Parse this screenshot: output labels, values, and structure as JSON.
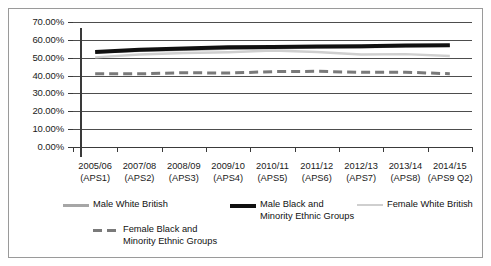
{
  "chart_data": {
    "type": "line",
    "title": "",
    "xlabel": "",
    "ylabel": "",
    "ylim": [
      0,
      70
    ],
    "grid": true,
    "legend_position": "bottom",
    "categories": [
      "2005/06\n(APS1)",
      "2007/08\n(APS2)",
      "2008/09\n(APS3)",
      "2009/10\n(APS4)",
      "2010/11\n(APS5)",
      "2011/12\n(APS6)",
      "2012/13\n(APS7)",
      "2013/14\n(APS8)",
      "2014/15\n(APS9 Q2)"
    ],
    "category_lines": [
      [
        "2005/06",
        "(APS1)"
      ],
      [
        "2007/08",
        "(APS2)"
      ],
      [
        "2008/09",
        "(APS3)"
      ],
      [
        "2009/10",
        "(APS4)"
      ],
      [
        "2010/11",
        "(APS5)"
      ],
      [
        "2011/12",
        "(APS6)"
      ],
      [
        "2012/13",
        "(APS7)"
      ],
      [
        "2013/14",
        "(APS8)"
      ],
      [
        "2014/15",
        "(APS9 Q2)"
      ]
    ],
    "ytick_labels": [
      "70.00%",
      "60.00%",
      "50.00%",
      "40.00%",
      "30.00%",
      "20.00%",
      "10.00%",
      "0.00%"
    ],
    "ytick_values": [
      70,
      60,
      50,
      40,
      30,
      20,
      10,
      0
    ],
    "series": [
      {
        "name": "Male White British",
        "color": "#a6a6a6",
        "style": "solid",
        "width": 3,
        "values": [
          53.2,
          54.0,
          54.6,
          55.2,
          55.5,
          55.8,
          56.0,
          56.5,
          56.8
        ]
      },
      {
        "name": "Male Black and Minority Ethnic Groups",
        "color": "#101010",
        "style": "solid",
        "width": 4,
        "values": [
          53.2,
          54.5,
          55.2,
          55.8,
          56.0,
          56.3,
          56.4,
          56.8,
          57.0
        ]
      },
      {
        "name": "Female White British",
        "color": "#cfcfcf",
        "style": "solid",
        "width": 2.4,
        "values": [
          50.2,
          51.8,
          52.6,
          53.1,
          54.0,
          53.2,
          51.8,
          52.0,
          51.0
        ]
      },
      {
        "name": "Female Black and Minority Ethnic Groups",
        "color": "#7a7a7a",
        "style": "dashed",
        "width": 3,
        "values": [
          41.0,
          41.0,
          41.6,
          41.4,
          42.2,
          42.4,
          41.8,
          41.9,
          41.0
        ]
      }
    ]
  },
  "legend": {
    "items": [
      {
        "label": "Male White British",
        "swatch": "sw-male-white"
      },
      {
        "label": "Male Black and\nMinority Ethnic Groups",
        "swatch": "sw-male-bme"
      },
      {
        "label": "Female White British",
        "swatch": "sw-female-white"
      },
      {
        "label": "Female Black and\nMinority Ethnic Groups",
        "swatch": "sw-female-bme"
      }
    ]
  }
}
